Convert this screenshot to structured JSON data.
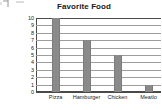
{
  "chart_data": {
    "type": "bar",
    "title": "Favorite Food",
    "xlabel": "",
    "ylabel": "",
    "categories": [
      "Pizza",
      "Hamburger",
      "Chicken",
      "Meatlo"
    ],
    "values": [
      10,
      7,
      5,
      1
    ],
    "ylim": [
      0,
      10
    ],
    "ytick_labels": [
      "10",
      "9",
      "8",
      "7",
      "6",
      "5",
      "4",
      "3",
      "2",
      "1",
      "0"
    ],
    "grid": true,
    "legend": "none",
    "bar_color": "#8a8a8a",
    "grid_color": "#9d9d9d",
    "axis_color": "#4a4a4a",
    "text_color": "#222222"
  },
  "artifacts": {
    "description": "faint scanner marks cut off at top-left"
  }
}
